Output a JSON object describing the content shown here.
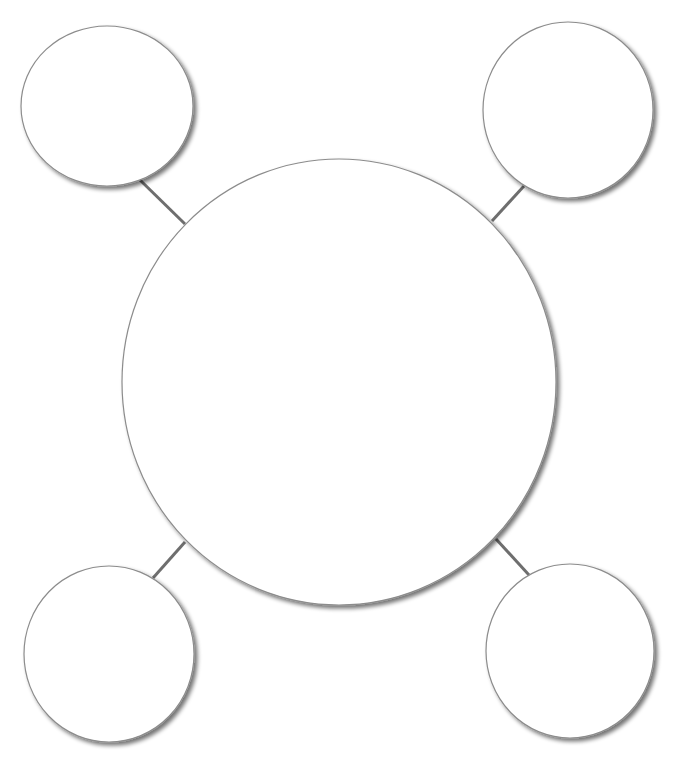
{
  "diagram": {
    "type": "bubble-map",
    "background": "#ffffff",
    "stroke_color": "#8c8c8c",
    "connector_color": "#6e6e6e",
    "fill_color": "#ffffff",
    "shadow_color": "#000000",
    "center_node": {
      "id": "center",
      "label": "",
      "cx": 339,
      "cy": 382,
      "rx": 217,
      "ry": 223
    },
    "satellite_nodes": [
      {
        "id": "top-left",
        "label": "",
        "cx": 107,
        "cy": 106,
        "rx": 86,
        "ry": 80
      },
      {
        "id": "top-right",
        "label": "",
        "cx": 568,
        "cy": 110,
        "rx": 85,
        "ry": 88
      },
      {
        "id": "bottom-left",
        "label": "",
        "cx": 109,
        "cy": 654,
        "rx": 85,
        "ry": 88
      },
      {
        "id": "bottom-right",
        "label": "",
        "cx": 570,
        "cy": 651,
        "rx": 84,
        "ry": 87
      }
    ],
    "connectors": [
      {
        "from": "top-left",
        "to": "center",
        "x1": 140,
        "y1": 180,
        "x2": 185,
        "y2": 224
      },
      {
        "from": "top-right",
        "to": "center",
        "x1": 524,
        "y1": 186,
        "x2": 492,
        "y2": 221
      },
      {
        "from": "bottom-left",
        "to": "center",
        "x1": 185,
        "y1": 542,
        "x2": 153,
        "y2": 578
      },
      {
        "from": "bottom-right",
        "to": "center",
        "x1": 496,
        "y1": 539,
        "x2": 529,
        "y2": 575
      }
    ]
  }
}
